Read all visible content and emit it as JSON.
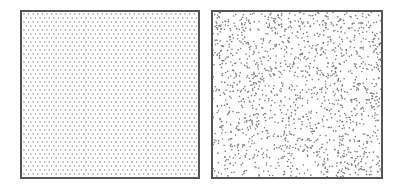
{
  "panels": [
    {
      "id": "left",
      "pattern": "regular-hexagonal-grid",
      "dot_color": "#8a8a8a",
      "dot_radius": 0.75,
      "spacing_x": 4.6,
      "spacing_y": 4.0,
      "border_color": "#555555"
    },
    {
      "id": "right",
      "pattern": "random-scatter",
      "dot_color": "#7a7a7a",
      "dot_radius": 0.8,
      "dot_count": 1500,
      "seed": 42,
      "border_color": "#555555"
    }
  ]
}
